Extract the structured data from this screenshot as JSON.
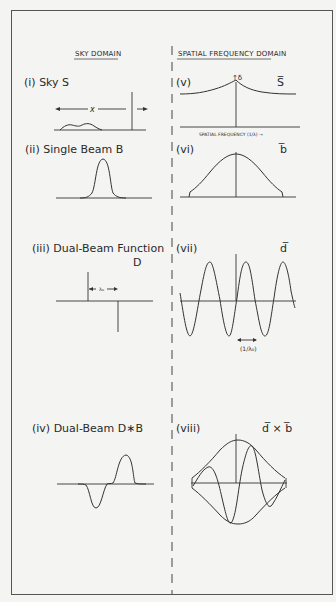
{
  "headers": {
    "sky": "SKY DOMAIN",
    "freq": "SPATIAL FREQUENCY DOMAIN"
  },
  "panels": {
    "i": {
      "label": "(i) Sky S",
      "x_label": "x"
    },
    "ii": {
      "label": "(ii)  Single Beam  B"
    },
    "iii": {
      "label": "(iii)  Dual-Beam Function",
      "sub": "D",
      "sep_label": "λ₀"
    },
    "iv": {
      "label": "(iv)  Dual-Beam D∗B"
    },
    "v": {
      "label": "(v)",
      "symbol": "S̅",
      "peak_label": "↑δ",
      "axis_label": "SPATIAL FREQUENCY (1/λ) →"
    },
    "vi": {
      "label": "(vi)",
      "symbol": "b̅"
    },
    "vii": {
      "label": "(vii)",
      "symbol": "d̅",
      "period_label": "(1/λ₀)"
    },
    "viii": {
      "label": "(viii)",
      "symbol": "d̅ × b̅"
    }
  }
}
